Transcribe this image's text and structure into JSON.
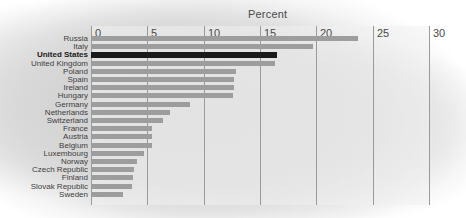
{
  "chart": {
    "title": "Percent",
    "type": "barh"
  },
  "chart_data": {
    "type": "bar",
    "orientation": "horizontal",
    "title": "Percent",
    "xlabel": "Percent",
    "ylabel": "",
    "xlim": [
      0,
      30
    ],
    "xticks": [
      0,
      5,
      10,
      15,
      20,
      25,
      30
    ],
    "tick_labels": [
      "0",
      "5",
      "10",
      "15",
      "20",
      "25",
      "30"
    ],
    "grid": "vertical",
    "legend": "none",
    "highlight_category": "United States",
    "colors": {
      "bar": "#9d9d9d",
      "bar_highlight": "#1a1a1a",
      "gridline": "#9a9a9a",
      "text": "#3d3d3d",
      "background": "#d8d8d8"
    },
    "categories": [
      "Russia",
      "Italy",
      "United States",
      "United Kingdom",
      "Poland",
      "Spain",
      "Ireland",
      "Hungary",
      "Germany",
      "Netherlands",
      "Switzerland",
      "France",
      "Austria",
      "Belgium",
      "Luxembourg",
      "Norway",
      "Czech Republic",
      "Finland",
      "Slovak Republic",
      "Sweden"
    ],
    "values": [
      23.7,
      19.7,
      16.5,
      16.3,
      12.9,
      12.7,
      12.7,
      12.6,
      8.8,
      7.0,
      6.4,
      5.4,
      5.4,
      5.4,
      4.7,
      4.1,
      3.8,
      3.7,
      3.6,
      2.8
    ]
  }
}
